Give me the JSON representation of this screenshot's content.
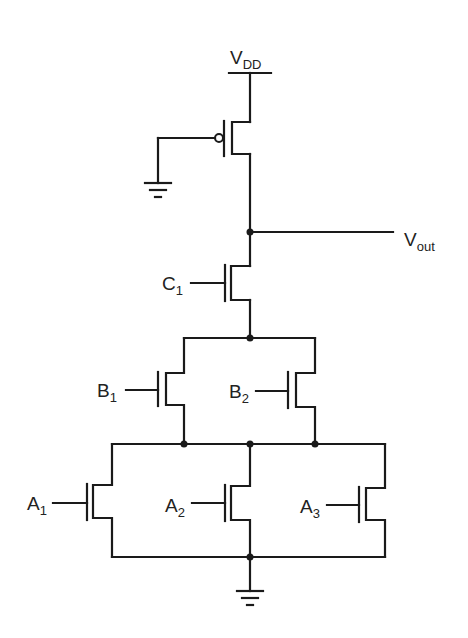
{
  "diagram": {
    "colors": {
      "wire": "#1a1a1a",
      "text": "#222222",
      "background": "#ffffff"
    },
    "labels": {
      "vdd": {
        "main": "V",
        "sub": "DD"
      },
      "vout": {
        "main": "V",
        "sub": "out"
      },
      "c1": {
        "main": "C",
        "sub": "1"
      },
      "b1": {
        "main": "B",
        "sub": "1"
      },
      "b2": {
        "main": "B",
        "sub": "2"
      },
      "a1": {
        "main": "A",
        "sub": "1"
      },
      "a2": {
        "main": "A",
        "sub": "2"
      },
      "a3": {
        "main": "A",
        "sub": "3"
      }
    },
    "nodes": [
      {
        "id": "vdd",
        "type": "supply"
      },
      {
        "id": "vout",
        "type": "output-node"
      },
      {
        "id": "n1",
        "type": "internal-node"
      },
      {
        "id": "n2",
        "type": "internal-node"
      },
      {
        "id": "gnd",
        "type": "ground"
      }
    ],
    "transistors": [
      {
        "id": "pmos-load",
        "type": "PMOS",
        "gate": "gnd",
        "drain": "vout",
        "source": "vdd"
      },
      {
        "id": "c1",
        "type": "NMOS",
        "gate": "C1",
        "drain": "vout",
        "source": "n1"
      },
      {
        "id": "b1",
        "type": "NMOS",
        "gate": "B1",
        "drain": "n1",
        "source": "n2",
        "connection": "parallel-with-b2"
      },
      {
        "id": "b2",
        "type": "NMOS",
        "gate": "B2",
        "drain": "n1",
        "source": "n2",
        "connection": "parallel-with-b1"
      },
      {
        "id": "a1",
        "type": "NMOS",
        "gate": "A1",
        "drain": "n2",
        "source": "gnd",
        "connection": "parallel"
      },
      {
        "id": "a2",
        "type": "NMOS",
        "gate": "A2",
        "drain": "n2",
        "source": "gnd",
        "connection": "parallel"
      },
      {
        "id": "a3",
        "type": "NMOS",
        "gate": "A3",
        "drain": "n2",
        "source": "gnd",
        "connection": "parallel"
      }
    ]
  }
}
